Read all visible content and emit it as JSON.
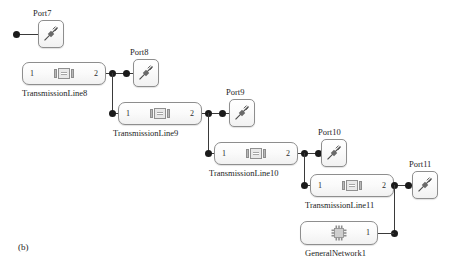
{
  "figure": {
    "caption": "(b)",
    "background": "#ffffff",
    "line_color": "#3a3a3a",
    "node_color": "#1b1b1b",
    "block_border": "#8e8e8e"
  },
  "blocks": [
    {
      "id": "port7",
      "type": "port",
      "label": "Port7",
      "icon": "port-probe-icon"
    },
    {
      "id": "transmissionline8",
      "type": "transmission-line",
      "label": "TransmissionLine8",
      "icon": "transmission-line-icon",
      "pin_left": "1",
      "pin_right": "2"
    },
    {
      "id": "port8",
      "type": "port",
      "label": "Port8",
      "icon": "port-probe-icon"
    },
    {
      "id": "transmissionline9",
      "type": "transmission-line",
      "label": "TransmissionLine9",
      "icon": "transmission-line-icon",
      "pin_left": "1",
      "pin_right": "2"
    },
    {
      "id": "port9",
      "type": "port",
      "label": "Port9",
      "icon": "port-probe-icon"
    },
    {
      "id": "transmissionline10",
      "type": "transmission-line",
      "label": "TransmissionLine10",
      "icon": "transmission-line-icon",
      "pin_left": "1",
      "pin_right": "2"
    },
    {
      "id": "port10",
      "type": "port",
      "label": "Port10",
      "icon": "port-probe-icon"
    },
    {
      "id": "transmissionline11",
      "type": "transmission-line",
      "label": "TransmissionLine11",
      "icon": "transmission-line-icon",
      "pin_left": "1",
      "pin_right": "2"
    },
    {
      "id": "port11",
      "type": "port",
      "label": "Port11",
      "icon": "port-probe-icon"
    },
    {
      "id": "generalnetwork1",
      "type": "general-network",
      "label": "GeneralNetwork1",
      "icon": "integrated-circuit-icon",
      "pin_right": "1"
    }
  ]
}
